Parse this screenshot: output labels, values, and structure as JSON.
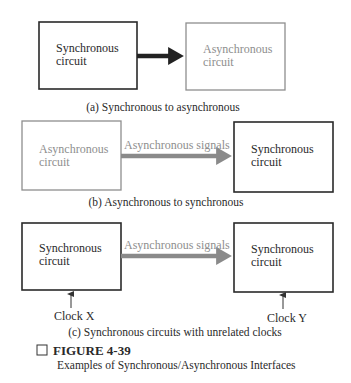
{
  "figure": {
    "number": "FIGURE 4-39",
    "caption": "Examples of Synchronous/Asynchronous Interfaces"
  },
  "panels": [
    {
      "id": "a",
      "caption": "(a) Synchronous to asynchronous",
      "left_box": {
        "line1": "Synchronous",
        "line2": "circuit",
        "style": "synchronous"
      },
      "right_box": {
        "line1": "Asynchronous",
        "line2": "circuit",
        "style": "asynchronous"
      },
      "arrow_label": ""
    },
    {
      "id": "b",
      "caption": "(b) Asynchronous to synchronous",
      "left_box": {
        "line1": "Asynchronous",
        "line2": "circuit",
        "style": "asynchronous"
      },
      "right_box": {
        "line1": "Synchronous",
        "line2": "circuit",
        "style": "synchronous"
      },
      "arrow_label": "Asynchronous signals"
    },
    {
      "id": "c",
      "caption": "(c) Synchronous circuits with unrelated clocks",
      "left_box": {
        "line1": "Synchronous",
        "line2": "circuit",
        "style": "synchronous"
      },
      "right_box": {
        "line1": "Synchronous",
        "line2": "circuit",
        "style": "synchronous"
      },
      "arrow_label": "Asynchronous signals",
      "left_clock": "Clock X",
      "right_clock": "Clock Y"
    }
  ],
  "colors": {
    "synchronous": "#2a2a2a",
    "asynchronous": "#8e8e8e",
    "arrow_dark": "#222222",
    "arrow_gray": "#8a8a8a"
  }
}
